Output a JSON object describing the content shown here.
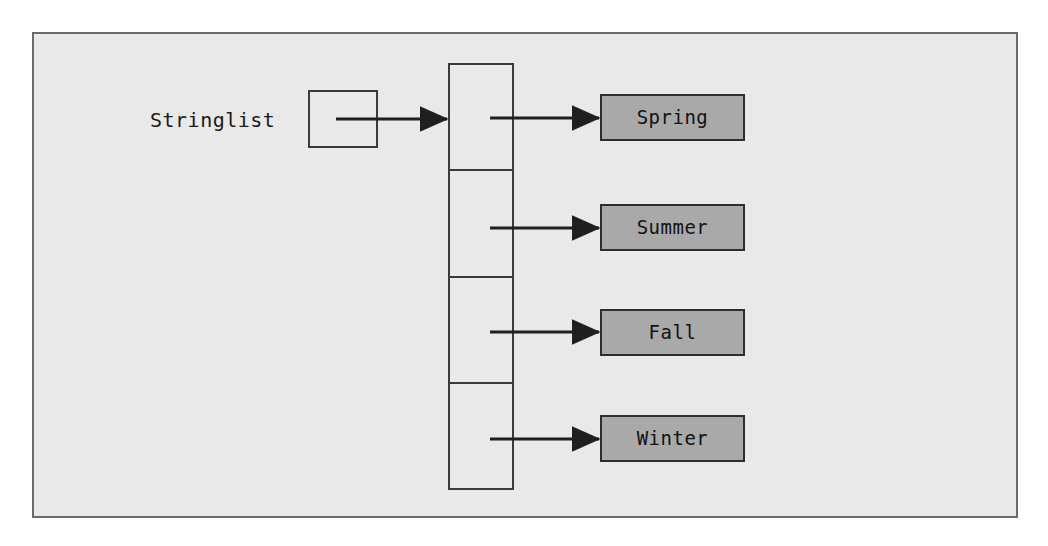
{
  "diagram": {
    "variable": {
      "label": "Stringlist",
      "box_name": "reference-box"
    },
    "array": {
      "name": "string-array",
      "cell_count": 4
    },
    "elements": [
      {
        "index": 0,
        "value": "Spring"
      },
      {
        "index": 1,
        "value": "Summer"
      },
      {
        "index": 2,
        "value": "Fall"
      },
      {
        "index": 3,
        "value": "Winter"
      }
    ],
    "arrows": [
      {
        "name": "arrow-variable-to-array",
        "from": "reference-box",
        "to": "string-array"
      },
      {
        "name": "arrow-cell-0-to-spring",
        "from": "array-cell-0",
        "to": "value-box-spring"
      },
      {
        "name": "arrow-cell-1-to-summer",
        "from": "array-cell-1",
        "to": "value-box-summer"
      },
      {
        "name": "arrow-cell-2-to-fall",
        "from": "array-cell-2",
        "to": "value-box-fall"
      },
      {
        "name": "arrow-cell-3-to-winter",
        "from": "array-cell-3",
        "to": "value-box-winter"
      }
    ],
    "colors": {
      "page_background": "#ffffff",
      "frame_background": "#e9e9e9",
      "frame_border": "#6b6b6b",
      "line": "#2e2e2e",
      "value_box_fill": "#a9a9a9",
      "text": "#121212"
    }
  }
}
